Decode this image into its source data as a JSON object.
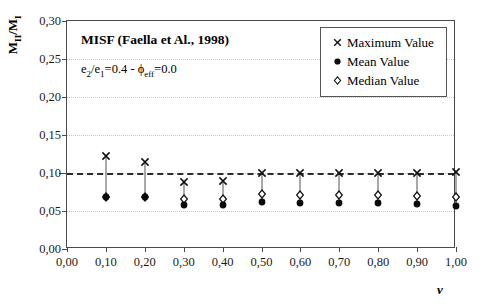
{
  "chart_data": {
    "type": "scatter",
    "title": "MISF (Faella et Al., 1998)",
    "subtitle_html": "e<sub>2</sub>/e<sub>1</sub>=0.4 - ϕ<sub>eff</sub>=0.0",
    "subtitle": "e2/e1=0.4 - ϕeff=0.0",
    "ylabel_html": "M<sub>II</sub>/M<sub>I</sub>",
    "ylabel": "MII/MI",
    "xlabel": "ν",
    "x": [
      0.1,
      0.2,
      0.3,
      0.4,
      0.5,
      0.6,
      0.7,
      0.8,
      0.9,
      1.0
    ],
    "xlim": [
      0.0,
      1.0
    ],
    "ylim": [
      0.0,
      0.3
    ],
    "xticks": [
      0.0,
      0.1,
      0.2,
      0.3,
      0.4,
      0.5,
      0.6,
      0.7,
      0.8,
      0.9,
      1.0
    ],
    "xtick_labels": [
      "0,00",
      "0,10",
      "0,20",
      "0,30",
      "0,40",
      "0,50",
      "0,60",
      "0,70",
      "0,80",
      "0,90",
      "1,00"
    ],
    "yticks": [
      0.0,
      0.05,
      0.1,
      0.15,
      0.2,
      0.25,
      0.3
    ],
    "ytick_labels": [
      "0,00",
      "0,05",
      "0,10",
      "0,15",
      "0,20",
      "0,25",
      "0,30"
    ],
    "grid": true,
    "legend_position": "top-right",
    "threshold_line": {
      "value": 0.1,
      "style": "dashed",
      "color": "#2b2b33"
    },
    "series": [
      {
        "name": "Maximum Value",
        "marker": "cross",
        "symbol": "×",
        "values": [
          0.122,
          0.114,
          0.088,
          0.09,
          0.1,
          0.1,
          0.1,
          0.1,
          0.1,
          0.101
        ]
      },
      {
        "name": "Mean Value",
        "marker": "filled-circle",
        "symbol": "●",
        "values": [
          0.068,
          0.069,
          0.058,
          0.058,
          0.062,
          0.061,
          0.06,
          0.06,
          0.059,
          0.057
        ]
      },
      {
        "name": "Median Value",
        "marker": "open-diamond",
        "symbol": "◇",
        "values": [
          0.068,
          0.069,
          0.066,
          0.066,
          0.072,
          0.071,
          0.071,
          0.071,
          0.07,
          0.069
        ]
      }
    ]
  },
  "legend": {
    "items": [
      {
        "label": "Maximum Value",
        "symbol": "×"
      },
      {
        "label": "Mean Value",
        "symbol": "●"
      },
      {
        "label": "Median Value",
        "symbol": "◇"
      }
    ]
  }
}
